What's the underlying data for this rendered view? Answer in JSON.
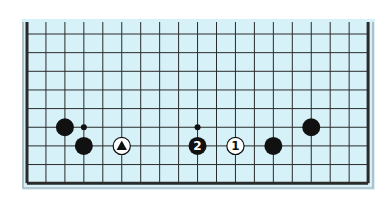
{
  "diagram": {
    "type": "go-board-fragment",
    "board_color": "#d7f1f8",
    "line_color": "#2a2a2a",
    "frame_color": "#9aa0a4",
    "columns": 19,
    "rows_visible": 9,
    "open_edge": "top",
    "stones": [
      {
        "color": "black",
        "col": 2,
        "row": 5,
        "label": ""
      },
      {
        "color": "black",
        "col": 3,
        "row": 6,
        "label": ""
      },
      {
        "color": "white",
        "col": 5,
        "row": 6,
        "label": "",
        "marker": "triangle"
      },
      {
        "color": "black",
        "col": 9,
        "row": 6,
        "label": "2"
      },
      {
        "color": "white",
        "col": 11,
        "row": 6,
        "label": "1"
      },
      {
        "color": "black",
        "col": 13,
        "row": 6,
        "label": ""
      },
      {
        "color": "black",
        "col": 15,
        "row": 5,
        "label": ""
      }
    ],
    "dots": [
      {
        "col": 3,
        "row": 5
      },
      {
        "col": 9,
        "row": 5
      }
    ]
  }
}
